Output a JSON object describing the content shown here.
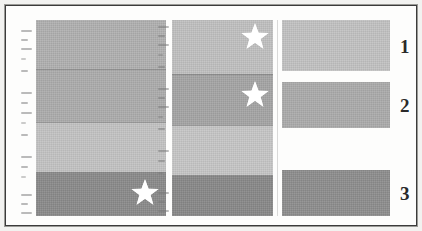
{
  "figure": {
    "background_color": "#fdfdfc",
    "frame_color": "#3b3b3b",
    "width": 422,
    "height": 231
  },
  "palette": {
    "light_gray": "#c3c3c3",
    "medium_light_gray": "#b4b4b4",
    "medium_gray": "#a7a7a7",
    "dark_gray": "#878787",
    "star_color": "#ffffff",
    "rule_color": "#5a5a5a",
    "label_color": "#2a2a2a"
  },
  "panels": [
    {
      "id": "panel-left",
      "bands": [
        {
          "index": 1,
          "color": "#b0b0b0",
          "has_star": false
        },
        {
          "index": 2,
          "color": "#acacac",
          "has_star": false
        },
        {
          "index": 3,
          "color": "#c3c3c3",
          "has_star": false
        },
        {
          "index": 4,
          "color": "#8a8a8a",
          "has_star": true
        }
      ]
    },
    {
      "id": "panel-middle",
      "bands": [
        {
          "index": 1,
          "color": "#c0c0c0",
          "has_star": true
        },
        {
          "index": 2,
          "color": "#a5a5a5",
          "has_star": true
        },
        {
          "index": 3,
          "color": "#c6c6c6",
          "has_star": false
        },
        {
          "index": 4,
          "color": "#888888",
          "has_star": false
        }
      ]
    }
  ],
  "legend": {
    "id": "panel-legend",
    "entries": [
      {
        "label": "1",
        "color": "#c2c2c2"
      },
      {
        "label": "2",
        "color": "#ababab"
      },
      {
        "label": "3",
        "color": "#8d8d8d"
      }
    ]
  },
  "axis_gutters": [
    {
      "id": "gutter-left",
      "legible": false
    },
    {
      "id": "gutter-middle",
      "legible": false
    }
  ]
}
